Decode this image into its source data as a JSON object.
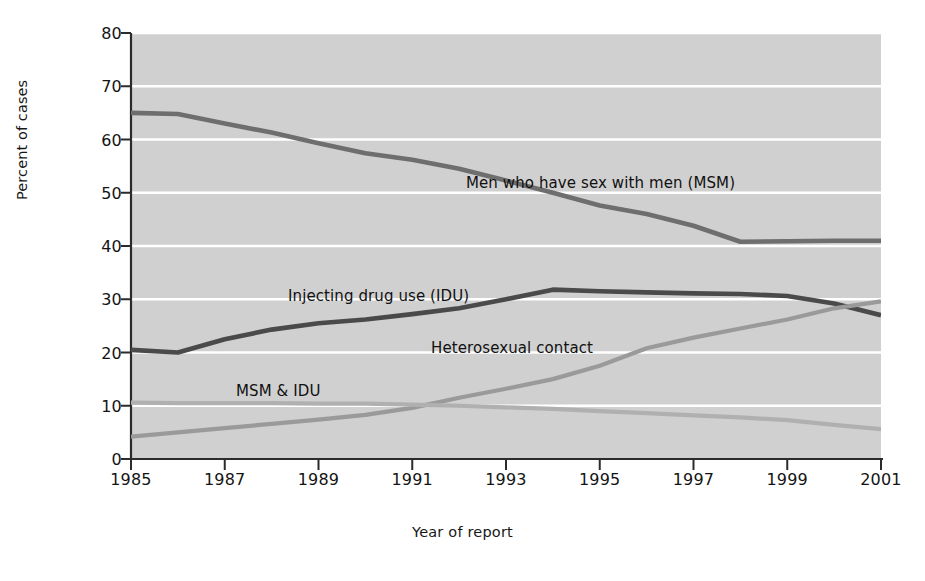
{
  "chart_data": {
    "type": "line",
    "title": "",
    "xlabel": "Year of report",
    "ylabel": "Percent of cases",
    "xlim": [
      1985,
      2001
    ],
    "ylim": [
      0,
      80
    ],
    "ytick_step": 10,
    "xtick_step": 2,
    "grid": "horizontal-white-lines-on-gray-panel",
    "legend_position": "inline-annotations",
    "x": [
      1985,
      1986,
      1987,
      1988,
      1989,
      1990,
      1991,
      1992,
      1993,
      1994,
      1995,
      1996,
      1997,
      1998,
      1999,
      2000,
      2001
    ],
    "xticks": [
      "1985",
      "1987",
      "1989",
      "1991",
      "1993",
      "1995",
      "1997",
      "1999",
      "2001"
    ],
    "yticks": [
      "0",
      "10",
      "20",
      "30",
      "40",
      "50",
      "60",
      "70",
      "80"
    ],
    "series": [
      {
        "name": "Men who have sex with men (MSM)",
        "color": "#6e6e6e",
        "values": [
          65.0,
          64.8,
          63.0,
          61.3,
          59.3,
          57.4,
          56.2,
          54.5,
          52.3,
          50.0,
          47.6,
          46.0,
          43.8,
          40.8,
          40.9,
          41.0,
          41.0
        ]
      },
      {
        "name": "Injecting drug use (IDU)",
        "color": "#4a4a4a",
        "values": [
          20.5,
          20.0,
          22.5,
          24.3,
          25.5,
          26.2,
          27.2,
          28.3,
          30.0,
          31.8,
          31.5,
          31.3,
          31.1,
          31.0,
          30.6,
          29.2,
          27.0
        ]
      },
      {
        "name": "Heterosexual contact",
        "color": "#9a9a9a",
        "values": [
          4.2,
          5.0,
          5.8,
          6.6,
          7.4,
          8.3,
          9.6,
          11.5,
          13.2,
          15.0,
          17.5,
          20.8,
          22.8,
          24.5,
          26.2,
          28.3,
          29.6
        ]
      },
      {
        "name": "MSM & IDU",
        "color": "#b0b0b0",
        "values": [
          10.6,
          10.5,
          10.5,
          10.5,
          10.4,
          10.4,
          10.2,
          10.0,
          9.7,
          9.4,
          9.0,
          8.6,
          8.2,
          7.8,
          7.3,
          6.4,
          5.6
        ]
      }
    ],
    "annotations": [
      {
        "text": "Men who have sex with men (MSM)",
        "x_px": 466,
        "y_px": 174
      },
      {
        "text": "Injecting drug use (IDU)",
        "x_px": 288,
        "y_px": 287
      },
      {
        "text": "Heterosexual contact",
        "x_px": 431,
        "y_px": 339
      },
      {
        "text": "MSM & IDU",
        "x_px": 236,
        "y_px": 382
      }
    ],
    "colors": {
      "panel_background": "#d0d0d0",
      "gridline": "#ffffff",
      "axis": "#2b2b2b",
      "text": "#141414"
    }
  }
}
